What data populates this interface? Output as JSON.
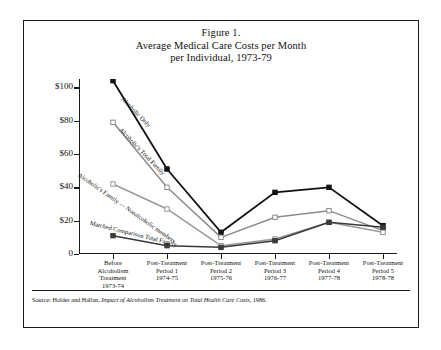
{
  "figure": {
    "title_lines": [
      "Figure 1.",
      "Average Medical Care Costs per Month",
      "per Individual, 1973-79"
    ],
    "source_prefix": "Source: Holder and Hallan, ",
    "source_italic": "Impact of Alcoholism Treatment on Total Health Care Costs",
    "source_suffix": ", 1986."
  },
  "chart_data": {
    "type": "line",
    "title": "Figure 1. Average Medical Care Costs per Month per Individual, 1973-79",
    "xlabel": "",
    "ylabel": "Inflation Adjusted Costs",
    "ylim": [
      0,
      100
    ],
    "yticks": [
      0,
      20,
      40,
      60,
      80,
      100
    ],
    "ytick_labels": [
      "0",
      "$20",
      "$40",
      "$60",
      "$80",
      "$100"
    ],
    "grid": false,
    "legend": "inline-annotations",
    "categories": [
      "Before Alcoholism Treatment 1973-74",
      "Post-Treatment Period 1 1974-75",
      "Post-Treatment Period 2 1975-76",
      "Post-Treatment Period 3 1976-77",
      "Post-Treatment Period 4 1977-78",
      "Post-Treatment Period 5 1978-78"
    ],
    "category_lines": [
      [
        "Before",
        "Alcoholism",
        "Treatment",
        "1973-74"
      ],
      [
        "Post-Treatment",
        "Period 1",
        "1974-75"
      ],
      [
        "Post-Treatment",
        "Period 2",
        "1975-76"
      ],
      [
        "Post-Treatment",
        "Period 3",
        "1976-77"
      ],
      [
        "Post-Treatment",
        "Period 4",
        "1977-78"
      ],
      [
        "Post-Treatment",
        "Period 5",
        "1978-78"
      ]
    ],
    "series": [
      {
        "name": "Alcoholic Only",
        "marker": "filled-square",
        "color": "#111111",
        "values": [
          104,
          51,
          13,
          37,
          40,
          17
        ]
      },
      {
        "name": "Alcoholic's Total Family",
        "marker": "open-square",
        "color": "#8c8c8c",
        "values": [
          79,
          40,
          10,
          22,
          26,
          14
        ]
      },
      {
        "name": "Alcoholic's Family — Nonalcoholic members",
        "marker": "open-square",
        "color": "#9a9a9a",
        "values": [
          42,
          27,
          5,
          9,
          19,
          13
        ]
      },
      {
        "name": "Matched Comparison Total Family",
        "marker": "filled-square",
        "color": "#3a3a3a",
        "values": [
          11,
          5,
          4,
          8,
          19,
          16
        ]
      }
    ]
  }
}
